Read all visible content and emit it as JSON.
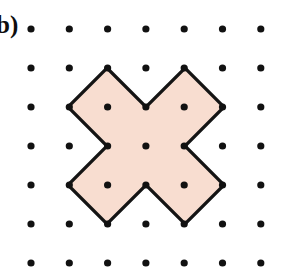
{
  "figure": {
    "panel_label": "b)",
    "background_color": "#ffffff",
    "canvas": {
      "width": 281,
      "height": 279
    }
  },
  "lattice": {
    "name": "dot-grid",
    "rows": 7,
    "cols": 7,
    "origin_x": 31,
    "origin_y": 29,
    "spacing_x": 38.3,
    "spacing_y": 39.0,
    "dot_radius": 3.6,
    "dot_color": "#111111"
  },
  "shape": {
    "name": "cross-polygon",
    "description": "X-shaped (rotated plus) dodecagon with all vertices on lattice points",
    "fill_color": "#f8ddd0",
    "stroke_color": "#141414",
    "stroke_width": 3.2,
    "vertex_count": 12,
    "vertices_grid": [
      [
        2,
        1
      ],
      [
        3,
        2
      ],
      [
        4,
        1
      ],
      [
        5,
        2
      ],
      [
        4,
        3
      ],
      [
        5,
        4
      ],
      [
        4,
        5
      ],
      [
        3,
        4
      ],
      [
        2,
        5
      ],
      [
        1,
        4
      ],
      [
        2,
        3
      ],
      [
        1,
        2
      ]
    ],
    "vertices_px": [
      [
        107,
        68
      ],
      [
        146,
        107
      ],
      [
        185,
        68
      ],
      [
        224,
        107
      ],
      [
        185,
        146
      ],
      [
        224,
        185
      ],
      [
        185,
        224
      ],
      [
        146,
        185
      ],
      [
        107,
        224
      ],
      [
        68,
        185
      ],
      [
        107,
        146
      ],
      [
        68,
        107
      ]
    ]
  },
  "chart_data": {
    "type": "scatter",
    "title": "",
    "xlabel": "",
    "ylabel": "",
    "xlim": [
      0,
      6
    ],
    "ylim": [
      0,
      6
    ],
    "grid": false,
    "legend": null,
    "series": [
      {
        "name": "lattice-points",
        "x": [
          0,
          1,
          2,
          3,
          4,
          5,
          6,
          0,
          1,
          2,
          3,
          4,
          5,
          6,
          0,
          1,
          2,
          3,
          4,
          5,
          6,
          0,
          1,
          2,
          3,
          4,
          5,
          6,
          0,
          1,
          2,
          3,
          4,
          5,
          6,
          0,
          1,
          2,
          3,
          4,
          5,
          6,
          0,
          1,
          2,
          3,
          4,
          5,
          6
        ],
        "y": [
          0,
          0,
          0,
          0,
          0,
          0,
          0,
          1,
          1,
          1,
          1,
          1,
          1,
          1,
          2,
          2,
          2,
          2,
          2,
          2,
          2,
          3,
          3,
          3,
          3,
          3,
          3,
          3,
          4,
          4,
          4,
          4,
          4,
          4,
          4,
          5,
          5,
          5,
          5,
          5,
          5,
          5,
          6,
          6,
          6,
          6,
          6,
          6,
          6
        ]
      }
    ],
    "annotations": [
      "b)"
    ]
  }
}
